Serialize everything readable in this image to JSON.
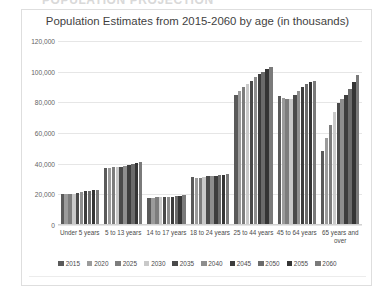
{
  "page": {
    "cut_off_heading": "POPULATION PROJECTION"
  },
  "card": {
    "title": "Population Estimates from 2015-2060 by age (in thousands)"
  },
  "chart_data": {
    "type": "bar",
    "title": "Population Estimates from 2015-2060 by age (in thousands)",
    "xlabel": "",
    "ylabel": "",
    "ylim": [
      0,
      120000
    ],
    "y_ticks": [
      0,
      20000,
      40000,
      60000,
      80000,
      100000,
      120000
    ],
    "y_tick_labels": [
      "0",
      "20,000",
      "40,000",
      "60,000",
      "80,000",
      "100,000",
      "120,000"
    ],
    "grid": true,
    "legend_position": "bottom",
    "categories": [
      "Under 5 years",
      "5 to 13 years",
      "14 to 17 years",
      "18 to 24 years",
      "25 to 44 years",
      "45 to 64 years",
      "65 years and over"
    ],
    "series": [
      {
        "name": "2015",
        "color": "#5a5a5a",
        "values": [
          20000,
          37000,
          17500,
          31000,
          85000,
          84000,
          48000
        ]
      },
      {
        "name": "2020",
        "color": "#9b9b9b",
        "values": [
          20500,
          37500,
          17500,
          30500,
          87500,
          83000,
          56500
        ]
      },
      {
        "name": "2025",
        "color": "#7d7d7d",
        "values": [
          20500,
          38000,
          18500,
          30500,
          90000,
          82500,
          65000
        ]
      },
      {
        "name": "2030",
        "color": "#c9c9c9",
        "values": [
          20500,
          38000,
          18500,
          31500,
          92000,
          82500,
          73500
        ]
      },
      {
        "name": "2035",
        "color": "#4a4a4a",
        "values": [
          21000,
          38000,
          18500,
          32000,
          94000,
          84500,
          79500
        ]
      },
      {
        "name": "2040",
        "color": "#8e8e8e",
        "values": [
          21500,
          38500,
          18500,
          32000,
          96500,
          87500,
          82500
        ]
      },
      {
        "name": "2045",
        "color": "#3d3d3d",
        "values": [
          22000,
          39000,
          18500,
          32000,
          98500,
          90000,
          85000
        ]
      },
      {
        "name": "2050",
        "color": "#6b6b6b",
        "values": [
          22500,
          40000,
          19000,
          32500,
          100000,
          92000,
          88500
        ]
      },
      {
        "name": "2055",
        "color": "#353535",
        "values": [
          23000,
          40500,
          19000,
          32500,
          101500,
          93000,
          93000
        ]
      },
      {
        "name": "2060",
        "color": "#7a7a7a",
        "values": [
          23000,
          41000,
          19500,
          33000,
          103000,
          94000,
          98000
        ]
      }
    ]
  }
}
